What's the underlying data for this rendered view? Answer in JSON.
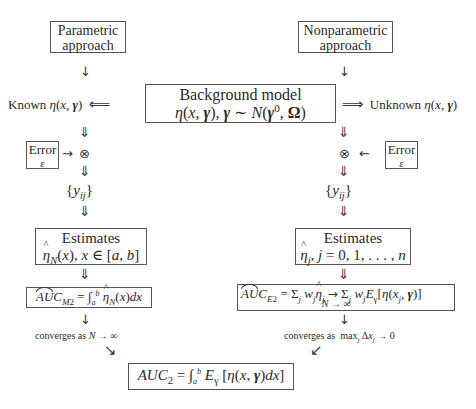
{
  "parametric": {
    "title_line1": "Parametric",
    "title_line2": "approach",
    "known_label": "Known η(x, γ)",
    "implied_by_arrow": "⟸",
    "down_arrow": "↓",
    "double_down": "⇓",
    "error_label": "Error",
    "error_symbol": "ε",
    "right_arrow": "→",
    "otimes": "⊗",
    "observations": "{y_ij}",
    "estimates_title": "Estimates",
    "estimates_expr": "η̂_N(x), x ∈ [a, b]",
    "auc_label": "AUC_M2",
    "auc_expr": "= ∫_a^b η̂_N(x)dx",
    "converges": "converges as N → ∞",
    "diag_arrow": "↘"
  },
  "background": {
    "title": "Background model",
    "expr": "η(x, γ), γ ∼ N(γ⁰, Ω)"
  },
  "nonparametric": {
    "title_line1": "Nonparametric",
    "title_line2": "approach",
    "unknown_label": "Unknown η(x, γ)",
    "implies_arrow": "⟹",
    "down_arrow": "↓",
    "double_down": "⇓",
    "error_label": "Error",
    "error_symbol": "ε",
    "left_arrow": "←",
    "otimes": "⊗",
    "observations": "{y_ij}",
    "estimates_title": "Estimates",
    "estimates_expr": "η̂_j, j = 0, 1, . . . , n",
    "auc_label": "AUC_E2",
    "auc_expr": "= Σ_j w_j η̂_j → Σ_j w_j E_γ[η(x_j, γ)]",
    "limit_under": "N → ∞",
    "converges": "converges as max_j Δx_j → 0",
    "diag_arrow": "↙"
  },
  "result": {
    "expr": "AUC_2 = ∫_a^b E_γ [η(x, γ)dx]"
  }
}
